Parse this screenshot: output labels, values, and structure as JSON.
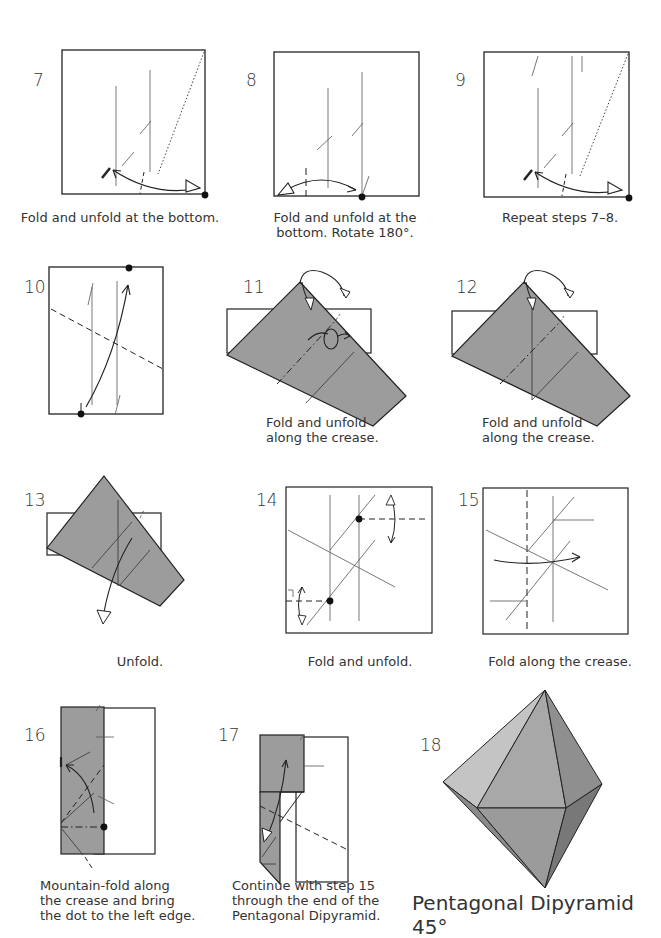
{
  "page": {
    "subject": "Pentagonal Dipyramid 45°",
    "colors": {
      "paper_gray": "#9c9c9c",
      "line": "#222222",
      "crease": "#555555",
      "background": "#ffffff"
    }
  },
  "steps": [
    {
      "number": "7",
      "caption": "Fold and unfold at the bottom."
    },
    {
      "number": "8",
      "caption_lines": [
        "Fold and unfold at the",
        "bottom. Rotate 180°."
      ]
    },
    {
      "number": "9",
      "caption": "Repeat steps 7–8."
    },
    {
      "number": "10",
      "caption": ""
    },
    {
      "number": "11",
      "caption_lines": [
        "Fold and unfold",
        "along the crease."
      ]
    },
    {
      "number": "12",
      "caption_lines": [
        "Fold and unfold",
        "along the crease."
      ]
    },
    {
      "number": "13",
      "caption": "Unfold."
    },
    {
      "number": "14",
      "caption": "Fold and unfold."
    },
    {
      "number": "15",
      "caption": "Fold along the crease."
    },
    {
      "number": "16",
      "caption_lines": [
        "Mountain-fold along",
        "the crease and bring",
        "the dot to the left edge."
      ]
    },
    {
      "number": "17",
      "caption_lines": [
        "Continue with step 15",
        "through the end of the",
        "Pentagonal Dipyramid."
      ]
    },
    {
      "number": "18",
      "caption": "Pentagonal Dipyramid 45°"
    }
  ],
  "symbols": {
    "turn_over": "turn-over-icon"
  }
}
